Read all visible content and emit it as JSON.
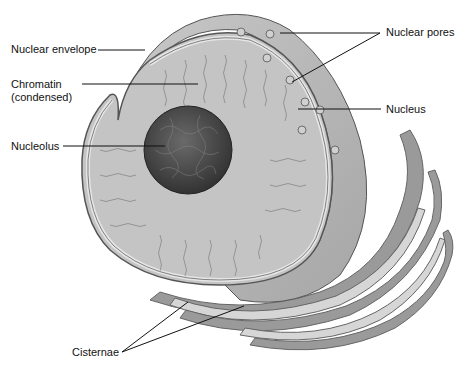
{
  "diagram": {
    "labels": {
      "nuclear_envelope": "Nuclear envelope",
      "chromatin_line1": "Chromatin",
      "chromatin_line2": "(condensed)",
      "nucleolus": "Nucleolus",
      "nuclear_pores": "Nuclear pores",
      "nucleus": "Nucleus",
      "cisternae": "Cisternae"
    },
    "colors": {
      "background": "#ffffff",
      "nucleoplasm": "#c4c4c4",
      "envelope_surface": "#b4b4b4",
      "nucleolus": "#4a4a4a",
      "er_dark": "#9a9a9a",
      "er_light": "#d6d6d6",
      "leader_lines": "#111111"
    }
  }
}
